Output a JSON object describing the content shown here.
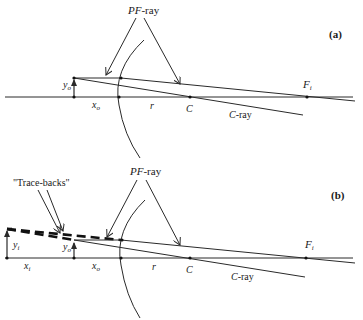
{
  "panels": [
    {
      "id": "a",
      "tag": "(a)",
      "labels": {
        "pf_ray_prefix": "PF",
        "pf_ray_suffix": "-ray",
        "c_ray_prefix": "C",
        "c_ray_suffix": "-ray",
        "object_height": "y",
        "object_height_sub": "o",
        "object_distance": "x",
        "object_distance_sub": "o",
        "radius": "r",
        "center": "C",
        "focus": "F",
        "focus_sub": "i"
      }
    },
    {
      "id": "b",
      "tag": "(b)",
      "labels": {
        "trace_backs": "\"Trace-backs\"",
        "pf_ray_prefix": "PF",
        "pf_ray_suffix": "-ray",
        "c_ray_prefix": "C",
        "c_ray_suffix": "-ray",
        "image_height": "y",
        "image_height_sub": "i",
        "image_distance": "x",
        "image_distance_sub": "i",
        "object_height": "y",
        "object_height_sub": "o",
        "object_distance": "x",
        "object_distance_sub": "o",
        "radius": "r",
        "center": "C",
        "focus": "F",
        "focus_sub": "i"
      }
    }
  ],
  "colors": {
    "line": "#2a2a2a",
    "background": "#ffffff"
  }
}
